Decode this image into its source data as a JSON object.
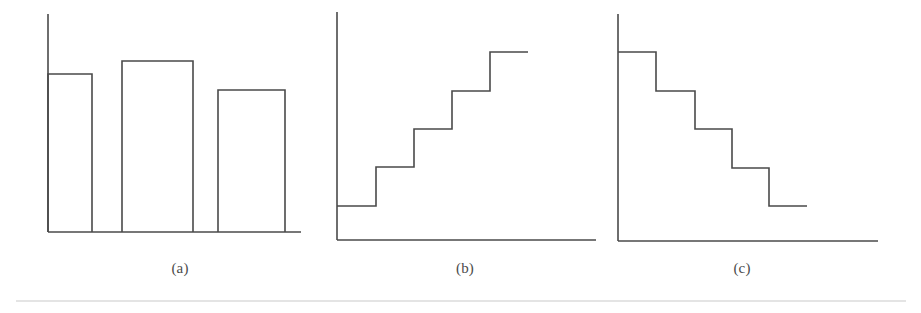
{
  "figure": {
    "background_color": "#ffffff",
    "stroke_color": "#4a4a4a",
    "stroke_width": 1.6,
    "separator_color": "#c9c9c9",
    "width": 921,
    "height": 313,
    "separator": {
      "x1": 16,
      "x2": 906,
      "y": 301
    }
  },
  "captions": {
    "a": "(a)",
    "b": "(b)",
    "c": "(c)"
  },
  "chart_data": [
    {
      "type": "bar",
      "panel": "a",
      "title": "(a)",
      "xlabel": "",
      "ylabel": "",
      "grid": false,
      "legend": "none",
      "categories": [
        "1",
        "2",
        "3"
      ],
      "values": [
        0.73,
        0.81,
        0.68
      ],
      "ylim": [
        0,
        1
      ],
      "axes": {
        "origin_x": 48,
        "baseline_y": 232,
        "y_axis_top": 14,
        "x_axis_right": 301
      },
      "bars": [
        {
          "x_left": 48,
          "x_right": 92,
          "top_y": 74
        },
        {
          "x_left": 122,
          "x_right": 193,
          "top_y": 61
        },
        {
          "x_left": 218,
          "x_right": 285,
          "top_y": 90
        }
      ],
      "caption_x": 180,
      "caption_y": 273
    },
    {
      "type": "step",
      "panel": "b",
      "title": "(b)",
      "xlabel": "",
      "ylabel": "",
      "grid": false,
      "legend": "none",
      "direction": "increasing",
      "categories": [
        "1",
        "2",
        "3",
        "4",
        "5"
      ],
      "values": [
        0.15,
        0.32,
        0.49,
        0.65,
        0.83
      ],
      "ylim": [
        0,
        1
      ],
      "axes": {
        "origin_x": 337,
        "baseline_y": 240,
        "y_axis_top": 12,
        "x_axis_right": 596
      },
      "steps": [
        {
          "x_start": 337,
          "x_end": 376,
          "level_y": 206
        },
        {
          "x_start": 376,
          "x_end": 414,
          "level_y": 167
        },
        {
          "x_start": 414,
          "x_end": 452,
          "level_y": 129
        },
        {
          "x_start": 452,
          "x_end": 490,
          "level_y": 91
        },
        {
          "x_start": 490,
          "x_end": 528,
          "level_y": 52
        }
      ],
      "caption_x": 465,
      "caption_y": 273
    },
    {
      "type": "step",
      "panel": "c",
      "title": "(c)",
      "xlabel": "",
      "ylabel": "",
      "grid": false,
      "legend": "none",
      "direction": "decreasing",
      "categories": [
        "1",
        "2",
        "3",
        "4",
        "5"
      ],
      "values": [
        0.83,
        0.65,
        0.49,
        0.32,
        0.15
      ],
      "ylim": [
        0,
        1
      ],
      "axes": {
        "origin_x": 618,
        "baseline_y": 241,
        "y_axis_top": 14,
        "x_axis_right": 878
      },
      "steps": [
        {
          "x_start": 618,
          "x_end": 656,
          "level_y": 52
        },
        {
          "x_start": 656,
          "x_end": 695,
          "level_y": 91
        },
        {
          "x_start": 695,
          "x_end": 732,
          "level_y": 129
        },
        {
          "x_start": 732,
          "x_end": 769,
          "level_y": 168
        },
        {
          "x_start": 769,
          "x_end": 807,
          "level_y": 206
        }
      ],
      "caption_x": 742,
      "caption_y": 273
    }
  ]
}
